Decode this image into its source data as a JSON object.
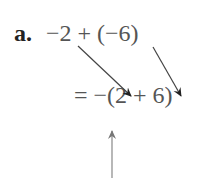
{
  "problem": {
    "label": "a.",
    "expression": "−2 + (−6)",
    "result": "= −(2 + 6)"
  },
  "annotations": {
    "arrows": [
      {
        "name": "arrow-from-2",
        "from": [
          78,
          46
        ],
        "to": [
          133,
          98
        ]
      },
      {
        "name": "arrow-from-6",
        "from": [
          153,
          47
        ],
        "to": [
          182,
          98
        ]
      },
      {
        "name": "arrow-to-negative-sign",
        "from": [
          112,
          178
        ],
        "to": [
          112,
          130
        ]
      }
    ]
  }
}
